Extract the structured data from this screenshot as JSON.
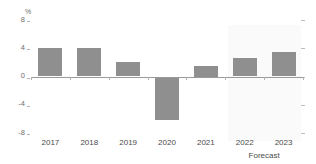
{
  "chart_data": {
    "type": "bar",
    "title": "",
    "subtitle": "",
    "xlabel": "",
    "ylabel": "%",
    "unit": "%",
    "categories": [
      "2017",
      "2018",
      "2019",
      "2020",
      "2021",
      "2022",
      "2023"
    ],
    "values": [
      4.1,
      4.1,
      2.1,
      -6.2,
      1.5,
      2.6,
      3.4
    ],
    "series": [
      {
        "name": "Annual change",
        "values": [
          4.1,
          4.1,
          2.1,
          -6.2,
          1.5,
          2.6,
          3.4
        ]
      }
    ],
    "ylim": [
      -8,
      8
    ],
    "yticks": [
      8,
      4,
      0,
      -4,
      -8
    ],
    "ytick_labels": [
      "8",
      "4",
      "0",
      "-4",
      "-8"
    ],
    "grid": false,
    "legend": "none",
    "annotations": [
      {
        "text": "Forecast",
        "covers": [
          "2022",
          "2023"
        ],
        "style": "shaded-band"
      }
    ],
    "bar_color": "#8f8f8f",
    "forecast_band_color": "#fafafa",
    "axis_color": "#9a9a9a",
    "tick_label_color": "#4a4a4a",
    "ytick_label_color": "#6e6e6e"
  },
  "axis": {
    "unit_label": "%",
    "forecast_caption": "Forecast"
  }
}
